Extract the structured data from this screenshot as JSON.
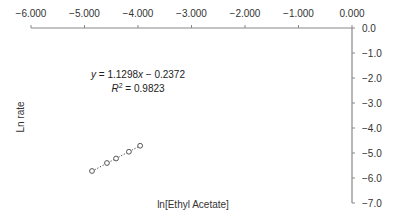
{
  "chart_data": {
    "type": "scatter",
    "title": "",
    "xlabel": "ln[Ethyl Acetate]",
    "ylabel": "Ln rate",
    "xlim": [
      -6.0,
      0.0
    ],
    "ylim": [
      -7.0,
      0.0
    ],
    "x_ticks": [
      "−6.000",
      "−5.000",
      "−4.000",
      "−3.000",
      "−2.000",
      "−1.000",
      "0.000"
    ],
    "x_tick_values": [
      -6,
      -5,
      -4,
      -3,
      -2,
      -1,
      0
    ],
    "y_ticks": [
      "0.0",
      "−1.0",
      "−2.0",
      "−3.0",
      "−4.0",
      "−5.0",
      "−6.0",
      "−7.0"
    ],
    "y_tick_values": [
      0,
      -1,
      -2,
      -3,
      -4,
      -5,
      -6,
      -7
    ],
    "x_axis_position": "top",
    "y_axis_position": "right",
    "grid": false,
    "legend": null,
    "series": [
      {
        "name": "data",
        "marker": "open-circle",
        "x": [
          -4.86,
          -4.58,
          -4.41,
          -4.17,
          -3.96
        ],
        "y": [
          -5.72,
          -5.4,
          -5.22,
          -4.95,
          -4.71
        ]
      }
    ],
    "trendline": {
      "type": "linear",
      "style": "dotted",
      "slope": 1.1298,
      "intercept": -0.2372,
      "r2": 0.9823,
      "x_range": [
        -4.86,
        -3.96
      ]
    },
    "annotations": [
      {
        "text": "y = 1.1298x − 0.2372"
      },
      {
        "text": "R2 = 0.9823"
      }
    ]
  },
  "labels": {
    "xlabel": "ln[Ethyl Acetate]",
    "ylabel": "Ln rate",
    "eq_y": "y",
    "eq_rest": " = 1.1298",
    "eq_x": "x",
    "eq_tail": " − 0.2372",
    "r2_R": "R",
    "r2_sup": "2",
    "r2_rest": " = 0.9823"
  },
  "colors": {
    "axis": "#888888",
    "marker": "#555555",
    "trendline": "#444444",
    "text": "#333333"
  }
}
